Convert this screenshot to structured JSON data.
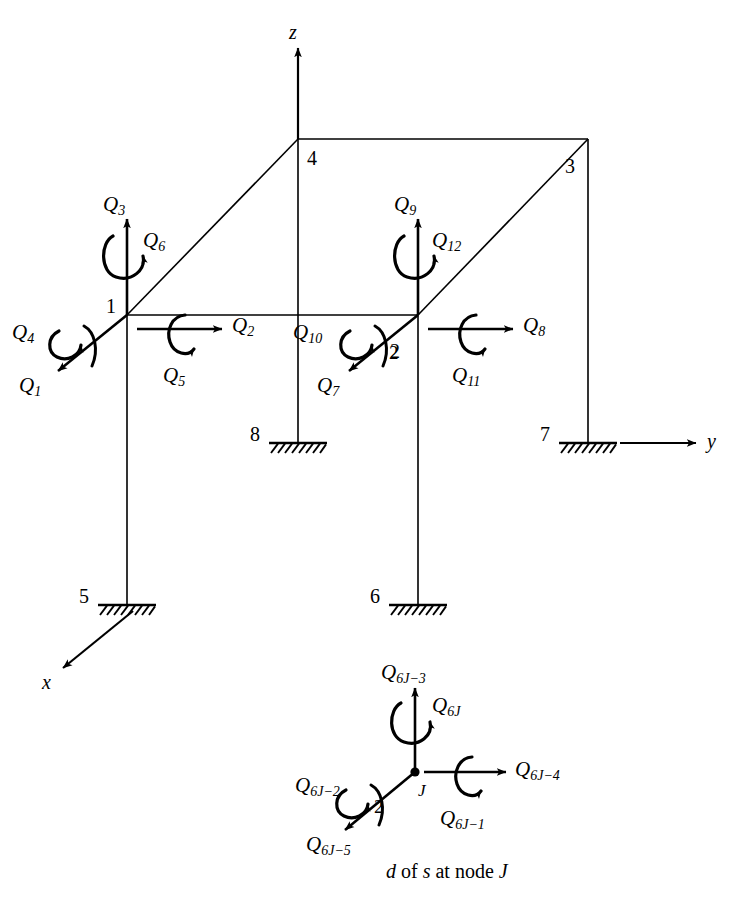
{
  "figure": {
    "caption": "d of s at node J",
    "caption_parts": {
      "d": "d",
      "of": "of",
      "s": "s",
      "at_node": "at node",
      "J": "J"
    },
    "ink_color": "#000000",
    "background_color": "#ffffff"
  },
  "axes": [
    {
      "name": "z-axis",
      "label": "z"
    },
    {
      "name": "y-axis",
      "label": "y"
    },
    {
      "name": "x-axis",
      "label": "x"
    }
  ],
  "nodes": [
    {
      "id": "node-1",
      "label": "1",
      "type": "joint"
    },
    {
      "id": "node-2",
      "label": "2",
      "type": "joint"
    },
    {
      "id": "node-3",
      "label": "3",
      "type": "joint"
    },
    {
      "id": "node-4",
      "label": "4",
      "type": "joint"
    },
    {
      "id": "node-5",
      "label": "5",
      "type": "fixed-support"
    },
    {
      "id": "node-6",
      "label": "6",
      "type": "fixed-support"
    },
    {
      "id": "node-7",
      "label": "7",
      "type": "fixed-support"
    },
    {
      "id": "node-8",
      "label": "8",
      "type": "fixed-support"
    }
  ],
  "node1_forces": {
    "axial_z": {
      "base": "Q",
      "sub": "3"
    },
    "torsion_z": {
      "base": "Q",
      "sub": "6"
    },
    "axial_y": {
      "base": "Q",
      "sub": "2"
    },
    "torsion_y": {
      "base": "Q",
      "sub": "5"
    },
    "torsion_x": {
      "base": "Q",
      "sub": "4"
    },
    "axial_x": {
      "base": "Q",
      "sub": "1"
    }
  },
  "node2_forces": {
    "axial_z": {
      "base": "Q",
      "sub": "9"
    },
    "torsion_z": {
      "base": "Q",
      "sub": "12"
    },
    "axial_y": {
      "base": "Q",
      "sub": "8"
    },
    "torsion_y": {
      "base": "Q",
      "sub": "11"
    },
    "torsion_x": {
      "base": "Q",
      "sub": "10"
    },
    "axial_x": {
      "base": "Q",
      "sub": "7"
    }
  },
  "inset": {
    "node_label": "J",
    "double_arrow_mark": "2",
    "forces": {
      "axial_z": {
        "base": "Q",
        "sub": "6J−3"
      },
      "torsion_z": {
        "base": "Q",
        "sub": "6J"
      },
      "axial_y": {
        "base": "Q",
        "sub": "6J−4"
      },
      "torsion_y": {
        "base": "Q",
        "sub": "6J−1"
      },
      "torsion_x": {
        "base": "Q",
        "sub": "6J−2"
      },
      "axial_x": {
        "base": "Q",
        "sub": "6J−5"
      }
    }
  }
}
